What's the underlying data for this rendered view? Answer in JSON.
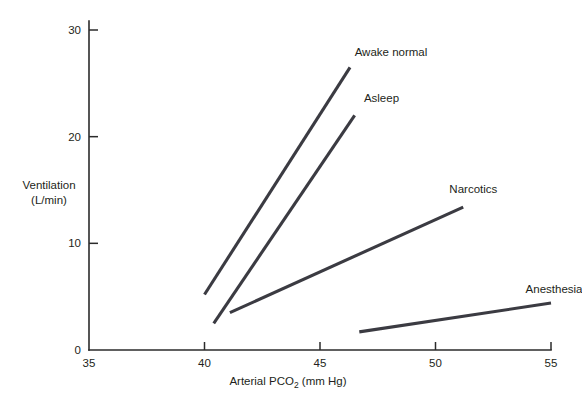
{
  "chart_data": {
    "type": "line",
    "title": "",
    "xlabel": "Arterial PCO2 (mm Hg)",
    "xlabel_prefix": "Arterial PCO",
    "xlabel_sub": "2",
    "xlabel_suffix": " (mm Hg)",
    "ylabel_line1": "Ventilation",
    "ylabel_line2": "(L/min)",
    "xlim": [
      35,
      55
    ],
    "ylim": [
      0,
      30
    ],
    "xticks": [
      35,
      40,
      45,
      50,
      55
    ],
    "xtick_labels": [
      "35",
      "40",
      "45",
      "50",
      "55"
    ],
    "yticks": [
      0,
      10,
      20,
      30
    ],
    "ytick_labels": [
      "0",
      "10",
      "20",
      "30"
    ],
    "grid": false,
    "legend": "inline-labels",
    "series": [
      {
        "name": "Awake normal",
        "label": "Awake normal",
        "x": [
          40.0,
          46.3
        ],
        "y": [
          5.2,
          26.5
        ],
        "label_x": 46.5,
        "label_y": 27.8
      },
      {
        "name": "Asleep",
        "label": "Asleep",
        "x": [
          40.4,
          46.5
        ],
        "y": [
          2.5,
          22.0
        ],
        "label_x": 46.9,
        "label_y": 23.5
      },
      {
        "name": "Narcotics",
        "label": "Narcotics",
        "x": [
          41.1,
          51.2
        ],
        "y": [
          3.5,
          13.4
        ],
        "label_x": 50.6,
        "label_y": 15.0
      },
      {
        "name": "Anesthesia",
        "label": "Anesthesia",
        "x": [
          46.7,
          55.0
        ],
        "y": [
          1.7,
          4.4
        ],
        "label_x": 53.9,
        "label_y": 5.6
      }
    ]
  }
}
